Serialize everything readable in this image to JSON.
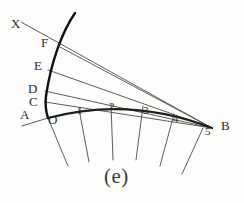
{
  "figure": {
    "caption": "(e)",
    "caption_pos": {
      "x": 104,
      "y": 166
    },
    "background": "#fdfdfc",
    "ink_color": "#2b2b2b",
    "thick_color": "#1a1a1a",
    "thin_color": "#4a4a4a"
  },
  "labels": {
    "X": {
      "text": "X",
      "x": 11,
      "y": 18
    },
    "F": {
      "text": "F",
      "x": 41,
      "y": 37
    },
    "E": {
      "text": "E",
      "x": 34,
      "y": 60
    },
    "D": {
      "text": "D",
      "x": 28,
      "y": 83
    },
    "C": {
      "text": "C",
      "x": 29,
      "y": 96
    },
    "A": {
      "text": "A",
      "x": 20,
      "y": 109
    },
    "O": {
      "text": "O",
      "x": 48,
      "y": 114
    },
    "B": {
      "text": "B",
      "x": 221,
      "y": 120
    },
    "t0": {
      "text": "1",
      "x": 77,
      "y": 104
    },
    "t1": {
      "text": "2",
      "x": 109,
      "y": 100
    },
    "t2": {
      "text": "3",
      "x": 143,
      "y": 104
    },
    "t3": {
      "text": "4",
      "x": 173,
      "y": 112
    },
    "t4": {
      "text": "5",
      "x": 205,
      "y": 125
    }
  },
  "geometry": {
    "base_arc": {
      "name": "base-arc",
      "path": "M 48 118 Q 130 96 212 128",
      "stroke_width": 2.2
    },
    "involute_curve": {
      "name": "involute-curve",
      "path": "M 75 13 C 62 32 51 62 46 96 C 45 105 46 112 48 118",
      "stroke_width": 2.4
    },
    "tangent_lines": [
      {
        "name": "tangent-X-F",
        "from": [
          21,
          22
        ],
        "to": [
          212,
          128
        ]
      },
      {
        "name": "tangent-F",
        "from": [
          60,
          47
        ],
        "to": [
          212,
          128
        ]
      },
      {
        "name": "tangent-E",
        "from": [
          48,
          70
        ],
        "to": [
          212,
          128
        ]
      },
      {
        "name": "tangent-D",
        "from": [
          45,
          91
        ],
        "to": [
          212,
          128
        ]
      },
      {
        "name": "tangent-C",
        "from": [
          45,
          102
        ],
        "to": [
          212,
          128
        ]
      },
      {
        "name": "tangent-A",
        "from": [
          22,
          126
        ],
        "to": [
          48,
          118
        ]
      }
    ],
    "radial_ticks": [
      {
        "name": "radial-tick-0",
        "from": [
          48,
          118
        ],
        "to": [
          68,
          166
        ]
      },
      {
        "name": "radial-tick-1",
        "from": [
          79,
          109
        ],
        "to": [
          89,
          162
        ]
      },
      {
        "name": "radial-tick-2",
        "from": [
          111,
          104
        ],
        "to": [
          113,
          160
        ]
      },
      {
        "name": "radial-tick-3",
        "from": [
          143,
          106
        ],
        "to": [
          136,
          160
        ]
      },
      {
        "name": "radial-tick-4",
        "from": [
          174,
          114
        ],
        "to": [
          160,
          166
        ]
      },
      {
        "name": "radial-tick-5",
        "from": [
          203,
          128
        ],
        "to": [
          182,
          174
        ]
      }
    ]
  }
}
